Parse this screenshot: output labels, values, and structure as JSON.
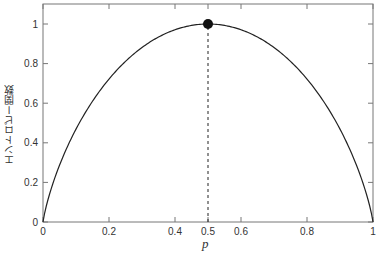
{
  "chart_data": {
    "type": "line",
    "title": "",
    "xlabel": "p",
    "ylabel": "エントロピー関数",
    "xlim": [
      0,
      1
    ],
    "ylim": [
      0,
      1.1
    ],
    "grid": false,
    "xticks": [
      "0",
      "0.2",
      "0.4",
      "0.5",
      "0.6",
      "0.8",
      "1"
    ],
    "xtick_values": [
      0,
      0.2,
      0.4,
      0.5,
      0.6,
      0.8,
      1
    ],
    "yticks": [
      "0",
      "0.2",
      "0.4",
      "0.6",
      "0.8",
      "1"
    ],
    "ytick_values": [
      0,
      0.2,
      0.4,
      0.6,
      0.8,
      1
    ],
    "series": [
      {
        "name": "binary entropy H(p) = -p log2 p - (1-p) log2 (1-p)",
        "x": [
          0,
          0.01,
          0.05,
          0.1,
          0.2,
          0.3,
          0.4,
          0.5,
          0.6,
          0.7,
          0.8,
          0.9,
          0.95,
          0.99,
          1
        ],
        "values": [
          0,
          0.081,
          0.286,
          0.469,
          0.722,
          0.881,
          0.971,
          1.0,
          0.971,
          0.881,
          0.722,
          0.469,
          0.286,
          0.081,
          0
        ],
        "color": "#222222"
      }
    ],
    "annotations": [
      {
        "type": "point",
        "x": 0.5,
        "y": 1.0,
        "marker": "filled-circle"
      },
      {
        "type": "vline",
        "x": 0.5,
        "from": 0,
        "to": 1.0,
        "style": "dashed"
      }
    ]
  },
  "labels": {
    "xlabel": "p",
    "ylabel": "エントロピー関数"
  }
}
